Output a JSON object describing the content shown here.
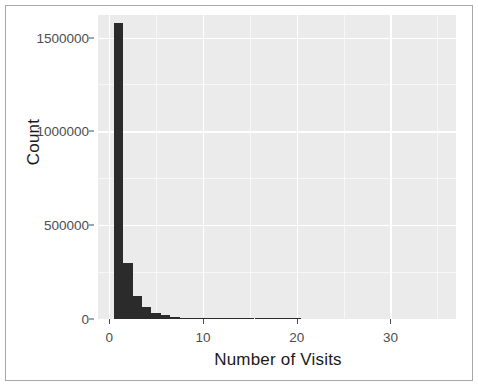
{
  "chart_data": {
    "type": "bar",
    "title": "",
    "subtitle": "",
    "xlabel": "Number of Visits",
    "ylabel": "Count",
    "xlim": [
      -1.2,
      37
    ],
    "ylim": [
      0,
      1620000
    ],
    "grid": true,
    "legend": null,
    "bin_width": 1,
    "x_ticks": [
      {
        "value": 0,
        "label": "0"
      },
      {
        "value": 10,
        "label": "10"
      },
      {
        "value": 20,
        "label": "20"
      },
      {
        "value": 30,
        "label": "30"
      }
    ],
    "y_ticks": [
      {
        "value": 0,
        "label": "0"
      },
      {
        "value": 500000,
        "label": "500000"
      },
      {
        "value": 1000000,
        "label": "1000000"
      },
      {
        "value": 1500000,
        "label": "1500000"
      }
    ],
    "x_minor_ticks": [
      5,
      15,
      25,
      35
    ],
    "y_minor_ticks": [
      250000,
      750000,
      1250000
    ],
    "categories": [
      1,
      2,
      3,
      4,
      5,
      6,
      7,
      8,
      9,
      10,
      11,
      12,
      13,
      14,
      15,
      16,
      17,
      18,
      19,
      20
    ],
    "values": [
      1580000,
      300000,
      120000,
      62000,
      34000,
      20000,
      13000,
      8000,
      5000,
      3200,
      2100,
      1400,
      900,
      600,
      420,
      300,
      210,
      150,
      110,
      80
    ],
    "colors": {
      "bar_fill": "#2b2b2b",
      "panel_background": "#ebebeb",
      "grid_line": "#ffffff",
      "axis_text": "#4d4d4d",
      "axis_title": "#1a1a1a",
      "figure_border": "#a8a8a8",
      "figure_background": "#ffffff"
    }
  }
}
